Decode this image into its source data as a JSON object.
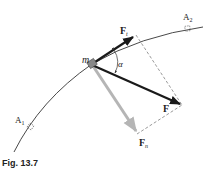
{
  "figure": {
    "caption": "Fig. 13.7",
    "labels": {
      "mass": "m",
      "tangential_force_main": "F",
      "tangential_force_sub": "t",
      "resultant_force": "F",
      "normal_force_main": "F",
      "normal_force_sub": "n",
      "angle": "α",
      "point_a1_main": "A",
      "point_a1_sub": "1",
      "point_a2_main": "A",
      "point_a2_sub": "2"
    },
    "colors": {
      "curve": "#333333",
      "force_vector": "#1a1a1a",
      "normal_vector": "#b5b5b5",
      "dashed_line": "#555555",
      "mass_block": "#888888"
    }
  }
}
